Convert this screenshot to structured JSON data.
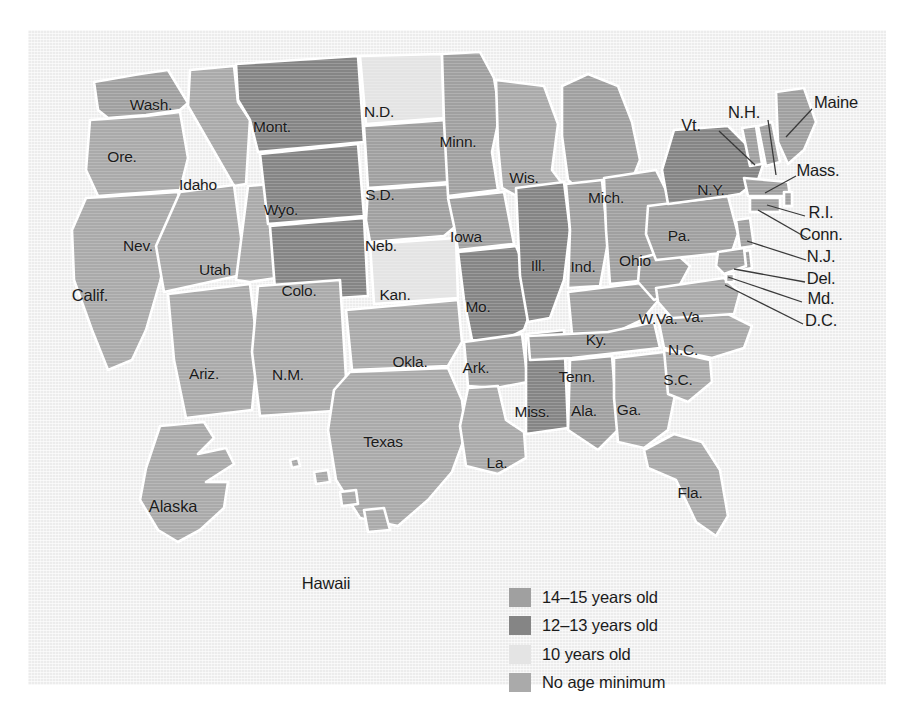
{
  "figure": {
    "panel_bg": "#ececec"
  },
  "legend": {
    "name": "map-legend",
    "items": [
      {
        "label": "14–15 years old",
        "color": "#a0a0a0",
        "key": "14-15"
      },
      {
        "label": "12–13 years old",
        "color": "#858585",
        "key": "12-13"
      },
      {
        "label": "10 years old",
        "color": "#e4e4e4",
        "key": "10"
      },
      {
        "label": "No age minimum",
        "color": "#aaaaaa",
        "key": "none"
      }
    ]
  },
  "chart_data": {
    "type": "map",
    "categories": [
      "14–15 years old",
      "12–13 years old",
      "10 years old",
      "No age minimum"
    ],
    "colors": {
      "14-15": "#a0a0a0",
      "12-13": "#858585",
      "10": "#e4e4e4",
      "none": "#aaaaaa"
    },
    "legend_position": "bottom-center",
    "grid": false,
    "states": [
      {
        "code": "WA",
        "label": "Wash.",
        "category": "14-15",
        "lx": 123,
        "ly": 75
      },
      {
        "code": "OR",
        "label": "Ore.",
        "category": "none",
        "lx": 94,
        "ly": 127
      },
      {
        "code": "CA",
        "label": "Calif.",
        "category": "none",
        "lx": 62,
        "ly": 265
      },
      {
        "code": "ID",
        "label": "Idaho",
        "category": "none",
        "lx": 170,
        "ly": 155
      },
      {
        "code": "NV",
        "label": "Nev.",
        "category": "none",
        "lx": 110,
        "ly": 216
      },
      {
        "code": "UT",
        "label": "Utah",
        "category": "none",
        "lx": 187,
        "ly": 240
      },
      {
        "code": "AZ",
        "label": "Ariz.",
        "category": "none",
        "lx": 176,
        "ly": 344
      },
      {
        "code": "MT",
        "label": "Mont.",
        "category": "12-13",
        "lx": 244,
        "ly": 97
      },
      {
        "code": "WY",
        "label": "Wyo.",
        "category": "12-13",
        "lx": 253,
        "ly": 180
      },
      {
        "code": "CO",
        "label": "Colo.",
        "category": "12-13",
        "lx": 271,
        "ly": 261
      },
      {
        "code": "NM",
        "label": "N.M.",
        "category": "none",
        "lx": 260,
        "ly": 345
      },
      {
        "code": "ND",
        "label": "N.D.",
        "category": "10",
        "lx": 351,
        "ly": 82
      },
      {
        "code": "SD",
        "label": "S.D.",
        "category": "14-15",
        "lx": 352,
        "ly": 165
      },
      {
        "code": "NE",
        "label": "Neb.",
        "category": "14-15",
        "lx": 353,
        "ly": 216
      },
      {
        "code": "KS",
        "label": "Kan.",
        "category": "10",
        "lx": 367,
        "ly": 265
      },
      {
        "code": "OK",
        "label": "Okla.",
        "category": "none",
        "lx": 382,
        "ly": 332
      },
      {
        "code": "TX",
        "label": "Texas",
        "category": "none",
        "lx": 355,
        "ly": 412
      },
      {
        "code": "MN",
        "label": "Minn.",
        "category": "14-15",
        "lx": 430,
        "ly": 112
      },
      {
        "code": "IA",
        "label": "Iowa",
        "category": "14-15",
        "lx": 438,
        "ly": 207
      },
      {
        "code": "MO",
        "label": "Mo.",
        "category": "12-13",
        "lx": 450,
        "ly": 277
      },
      {
        "code": "AR",
        "label": "Ark.",
        "category": "14-15",
        "lx": 448,
        "ly": 338
      },
      {
        "code": "LA",
        "label": "La.",
        "category": "none",
        "lx": 469,
        "ly": 433
      },
      {
        "code": "WI",
        "label": "Wis.",
        "category": "none",
        "lx": 496,
        "ly": 148
      },
      {
        "code": "IL",
        "label": "Ill.",
        "category": "12-13",
        "lx": 510,
        "ly": 236
      },
      {
        "code": "MS",
        "label": "Miss.",
        "category": "12-13",
        "lx": 504,
        "ly": 382
      },
      {
        "code": "MI",
        "label": "Mich.",
        "category": "14-15",
        "lx": 578,
        "ly": 168
      },
      {
        "code": "IN",
        "label": "Ind.",
        "category": "14-15",
        "lx": 555,
        "ly": 237
      },
      {
        "code": "KY",
        "label": "Ky.",
        "category": "14-15",
        "lx": 568,
        "ly": 310
      },
      {
        "code": "TN",
        "label": "Tenn.",
        "category": "14-15",
        "lx": 549,
        "ly": 347
      },
      {
        "code": "AL",
        "label": "Ala.",
        "category": "14-15",
        "lx": 556,
        "ly": 381
      },
      {
        "code": "OH",
        "label": "Ohio",
        "category": "14-15",
        "lx": 607,
        "ly": 231
      },
      {
        "code": "WV",
        "label": "W.Va.",
        "category": "14-15",
        "lx": 630,
        "ly": 289
      },
      {
        "code": "GA",
        "label": "Ga.",
        "category": "none",
        "lx": 601,
        "ly": 380
      },
      {
        "code": "FL",
        "label": "Fla.",
        "category": "none",
        "lx": 662,
        "ly": 463
      },
      {
        "code": "SC",
        "label": "S.C.",
        "category": "none",
        "lx": 650,
        "ly": 350
      },
      {
        "code": "NC",
        "label": "N.C.",
        "category": "none",
        "lx": 655,
        "ly": 320
      },
      {
        "code": "VA",
        "label": "Va.",
        "category": "none",
        "lx": 665,
        "ly": 287
      },
      {
        "code": "PA",
        "label": "Pa.",
        "category": "14-15",
        "lx": 651,
        "ly": 206
      },
      {
        "code": "NY",
        "label": "N.Y.",
        "category": "12-13",
        "lx": 683,
        "ly": 160
      },
      {
        "code": "AK",
        "label": "Alaska",
        "category": "none",
        "lx": 145,
        "ly": 476
      },
      {
        "code": "HI",
        "label": "Hawaii",
        "category": "none",
        "lx": 298,
        "ly": 553
      }
    ],
    "callouts": [
      {
        "code": "VT",
        "label": "Vt.",
        "tx": 663,
        "ty": 95,
        "x1": 691,
        "y1": 101,
        "x2": 727,
        "y2": 135
      },
      {
        "code": "NH",
        "label": "N.H.",
        "tx": 716,
        "ty": 82,
        "x1": 740,
        "y1": 90,
        "x2": 748,
        "y2": 145
      },
      {
        "code": "ME",
        "label": "Maine",
        "tx": 808,
        "ty": 72,
        "x1": 784,
        "y1": 79,
        "x2": 758,
        "y2": 107
      },
      {
        "code": "MA",
        "label": "Mass.",
        "tx": 790,
        "ty": 140,
        "x1": 768,
        "y1": 146,
        "x2": 737,
        "y2": 163
      },
      {
        "code": "RI",
        "label": "R.I.",
        "tx": 793,
        "ty": 182,
        "x1": 777,
        "y1": 186,
        "x2": 739,
        "y2": 175
      },
      {
        "code": "CT",
        "label": "Conn.",
        "tx": 793,
        "ty": 204,
        "x1": 779,
        "y1": 208,
        "x2": 730,
        "y2": 180
      },
      {
        "code": "NJ",
        "label": "N.J.",
        "tx": 793,
        "ty": 226,
        "x1": 778,
        "y1": 230,
        "x2": 719,
        "y2": 211
      },
      {
        "code": "DE",
        "label": "Del.",
        "tx": 793,
        "ty": 248,
        "x1": 777,
        "y1": 252,
        "x2": 706,
        "y2": 239
      },
      {
        "code": "MD",
        "label": "Md.",
        "tx": 793,
        "ty": 268,
        "x1": 774,
        "y1": 272,
        "x2": 700,
        "y2": 247
      },
      {
        "code": "DC",
        "label": "D.C.",
        "tx": 793,
        "ty": 290,
        "x1": 775,
        "y1": 294,
        "x2": 697,
        "y2": 255
      }
    ]
  }
}
